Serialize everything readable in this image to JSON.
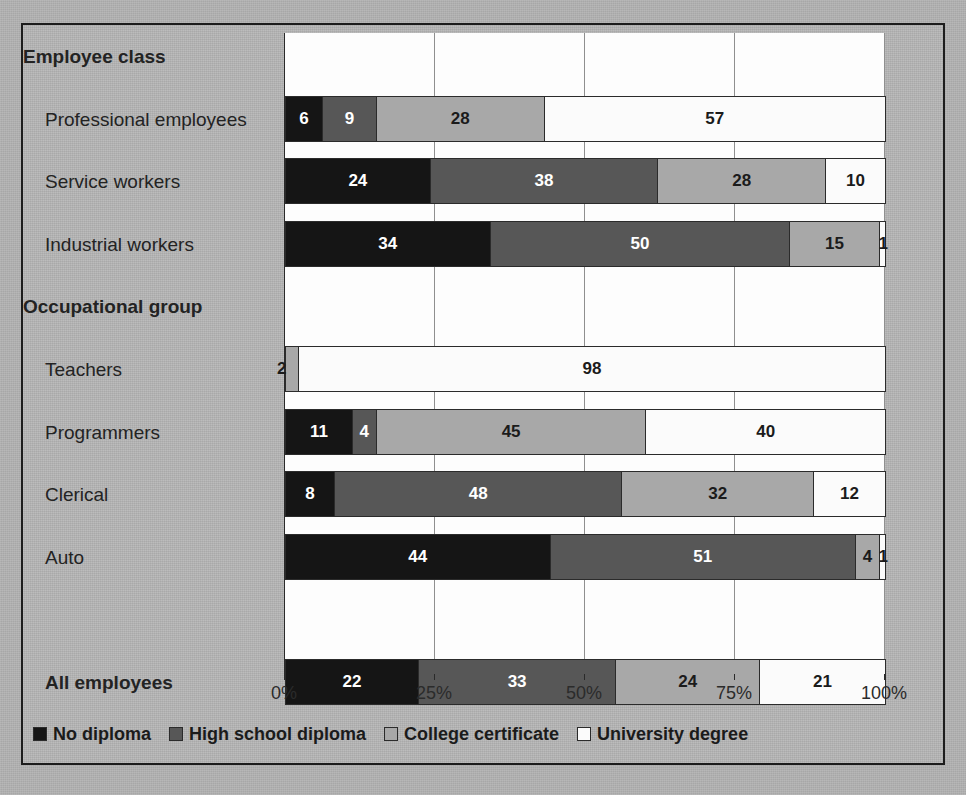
{
  "chart_data": {
    "type": "bar",
    "orientation": "horizontal",
    "stacked": true,
    "stack_total": 100,
    "title": "",
    "xlabel": "",
    "ylabel": "",
    "xlim": [
      0,
      100
    ],
    "grid": true,
    "legend_position": "bottom",
    "xticks": [
      "0%",
      "25%",
      "50%",
      "75%",
      "100%"
    ],
    "xtick_values": [
      0,
      25,
      50,
      75,
      100
    ],
    "series": [
      {
        "name": "No diploma",
        "color": "#151515",
        "values": [
          6,
          24,
          34,
          2,
          11,
          8,
          44,
          22
        ]
      },
      {
        "name": "High school diploma",
        "color": "#575757",
        "values": [
          9,
          38,
          50,
          0,
          4,
          48,
          51,
          33
        ]
      },
      {
        "name": "College certificate",
        "color": "#a8a8a8",
        "values": [
          28,
          28,
          15,
          0,
          45,
          32,
          4,
          24
        ]
      },
      {
        "name": "University degree",
        "color": "#fbfbfb",
        "values": [
          57,
          10,
          1,
          98,
          40,
          12,
          1,
          21
        ]
      }
    ],
    "categories": [
      "Professional employees",
      "Service workers",
      "Industrial workers",
      "Teachers",
      "Programmers",
      "Clerical",
      "Auto",
      "All employees"
    ],
    "group_headers": [
      "Employee class",
      "Occupational group"
    ]
  },
  "rows": [
    {
      "label": "Employee class",
      "kind": "header",
      "segments": []
    },
    {
      "label": "Professional employees",
      "kind": "category",
      "segments": [
        {
          "v": 6,
          "c": 0,
          "t": "6"
        },
        {
          "v": 9,
          "c": 1,
          "t": "9"
        },
        {
          "v": 28,
          "c": 2,
          "t": "28"
        },
        {
          "v": 57,
          "c": 3,
          "t": "57"
        }
      ]
    },
    {
      "label": "Service workers",
      "kind": "category",
      "segments": [
        {
          "v": 24,
          "c": 0,
          "t": "24"
        },
        {
          "v": 38,
          "c": 1,
          "t": "38"
        },
        {
          "v": 28,
          "c": 2,
          "t": "28"
        },
        {
          "v": 10,
          "c": 3,
          "t": "10"
        }
      ]
    },
    {
      "label": "Industrial workers",
      "kind": "category",
      "segments": [
        {
          "v": 34,
          "c": 0,
          "t": "34"
        },
        {
          "v": 50,
          "c": 1,
          "t": "50"
        },
        {
          "v": 15,
          "c": 2,
          "t": "15"
        },
        {
          "v": 1,
          "c": 3,
          "t": "1",
          "tiny": true,
          "onbar": true
        }
      ]
    },
    {
      "label": "Occupational group",
      "kind": "header",
      "segments": []
    },
    {
      "label": "Teachers",
      "kind": "category",
      "segments": [
        {
          "v": 2,
          "c": 2,
          "t": "2",
          "tiny": true
        },
        {
          "v": 98,
          "c": 3,
          "t": "98"
        }
      ]
    },
    {
      "label": "Programmers",
      "kind": "category",
      "segments": [
        {
          "v": 11,
          "c": 0,
          "t": "11"
        },
        {
          "v": 4,
          "c": 1,
          "t": "4"
        },
        {
          "v": 45,
          "c": 2,
          "t": "45"
        },
        {
          "v": 40,
          "c": 3,
          "t": "40"
        }
      ]
    },
    {
      "label": "Clerical",
      "kind": "category",
      "segments": [
        {
          "v": 8,
          "c": 0,
          "t": "8"
        },
        {
          "v": 48,
          "c": 1,
          "t": "48"
        },
        {
          "v": 32,
          "c": 2,
          "t": "32"
        },
        {
          "v": 12,
          "c": 3,
          "t": "12"
        }
      ]
    },
    {
      "label": "Auto",
      "kind": "category",
      "segments": [
        {
          "v": 44,
          "c": 0,
          "t": "44"
        },
        {
          "v": 51,
          "c": 1,
          "t": "51"
        },
        {
          "v": 4,
          "c": 2,
          "t": "4"
        },
        {
          "v": 1,
          "c": 3,
          "t": "1",
          "tiny": true,
          "onbar": true
        }
      ]
    },
    {
      "label": "",
      "kind": "spacer",
      "segments": []
    },
    {
      "label": "All employees",
      "kind": "total",
      "segments": [
        {
          "v": 22,
          "c": 0,
          "t": "22"
        },
        {
          "v": 33,
          "c": 1,
          "t": "33"
        },
        {
          "v": 24,
          "c": 2,
          "t": "24"
        },
        {
          "v": 21,
          "c": 3,
          "t": "21"
        }
      ]
    }
  ],
  "legend": {
    "items": [
      {
        "label": "No diploma",
        "color": "#151515"
      },
      {
        "label": "High school diploma",
        "color": "#575757"
      },
      {
        "label": "College certificate",
        "color": "#a8a8a8"
      },
      {
        "label": "University degree",
        "color": "#fbfbfb"
      }
    ]
  },
  "axis": {
    "ticks": [
      {
        "label": "0%",
        "value": 0
      },
      {
        "label": "25%",
        "value": 25
      },
      {
        "label": "50%",
        "value": 50
      },
      {
        "label": "75%",
        "value": 75
      },
      {
        "label": "100%",
        "value": 100
      }
    ]
  }
}
